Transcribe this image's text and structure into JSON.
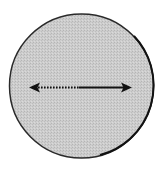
{
  "diagram": {
    "shape": "circle",
    "fill_color": "#c8c8c8",
    "border_color": "#1a1a1a",
    "arrow": {
      "type": "double-headed",
      "left_segment_style": "dotted",
      "right_segment_style": "solid",
      "color": "#111111"
    }
  }
}
